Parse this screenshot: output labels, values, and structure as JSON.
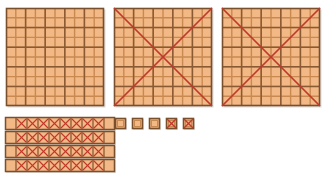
{
  "canvas": {
    "width": 328,
    "height": 181,
    "background": "#ffffff"
  },
  "colors": {
    "fill": "#f2b885",
    "fill_light": "#f7cfa8",
    "grid_line": "#8a5a33",
    "minor_line": "#c98a52",
    "outline": "#7a4f2c",
    "cross_out": "#c0392b",
    "shadow": "#b9b0a6"
  },
  "legend": {
    "title": "Base-Ten Blocks",
    "hundred_label": "hundred-flat",
    "ten_label": "ten-rod",
    "unit_label": "unit-cube",
    "crossed_out_label": "crossed out"
  },
  "counts": {
    "hundreds_total": 3,
    "hundreds_crossed_out": 2,
    "tens_total": 4,
    "tens_crossed_out": 4,
    "units_total": 5,
    "units_crossed_out": 2
  },
  "hundreds": [
    {
      "id": "hundred-1",
      "x": 6,
      "y": 8,
      "size": 98,
      "rows": 10,
      "cols": 10,
      "crossed_out": false,
      "value": 100
    },
    {
      "id": "hundred-2",
      "x": 114,
      "y": 8,
      "size": 98,
      "rows": 10,
      "cols": 10,
      "crossed_out": true,
      "value": 100
    },
    {
      "id": "hundred-3",
      "x": 222,
      "y": 8,
      "size": 98,
      "rows": 10,
      "cols": 10,
      "crossed_out": true,
      "value": 100
    }
  ],
  "tens": [
    {
      "id": "ten-1",
      "x": 5,
      "y": 117,
      "width": 110,
      "height": 13,
      "cells": 10,
      "crossed_cells": [
        1,
        2,
        3,
        4,
        5,
        6,
        7,
        8
      ],
      "value": 10
    },
    {
      "id": "ten-2",
      "x": 5,
      "y": 131,
      "width": 110,
      "height": 13,
      "cells": 10,
      "crossed_cells": [
        1,
        2,
        3,
        4,
        5,
        6,
        7,
        8
      ],
      "value": 10
    },
    {
      "id": "ten-3",
      "x": 5,
      "y": 145,
      "width": 110,
      "height": 13,
      "cells": 10,
      "crossed_cells": [
        1,
        2,
        3,
        4,
        5,
        6,
        7,
        8
      ],
      "value": 10
    },
    {
      "id": "ten-4",
      "x": 5,
      "y": 159,
      "width": 110,
      "height": 13,
      "cells": 10,
      "crossed_cells": [
        1,
        2,
        3,
        4,
        5,
        6,
        7,
        8
      ],
      "value": 10
    }
  ],
  "units": [
    {
      "id": "unit-1",
      "x": 115,
      "y": 118,
      "size": 11,
      "crossed_out": false,
      "value": 1
    },
    {
      "id": "unit-2",
      "x": 132,
      "y": 118,
      "size": 11,
      "crossed_out": false,
      "value": 1
    },
    {
      "id": "unit-3",
      "x": 149,
      "y": 118,
      "size": 11,
      "crossed_out": false,
      "value": 1
    },
    {
      "id": "unit-4",
      "x": 166,
      "y": 118,
      "size": 11,
      "crossed_out": true,
      "value": 1
    },
    {
      "id": "unit-5",
      "x": 183,
      "y": 118,
      "size": 11,
      "crossed_out": true,
      "value": 1
    }
  ]
}
